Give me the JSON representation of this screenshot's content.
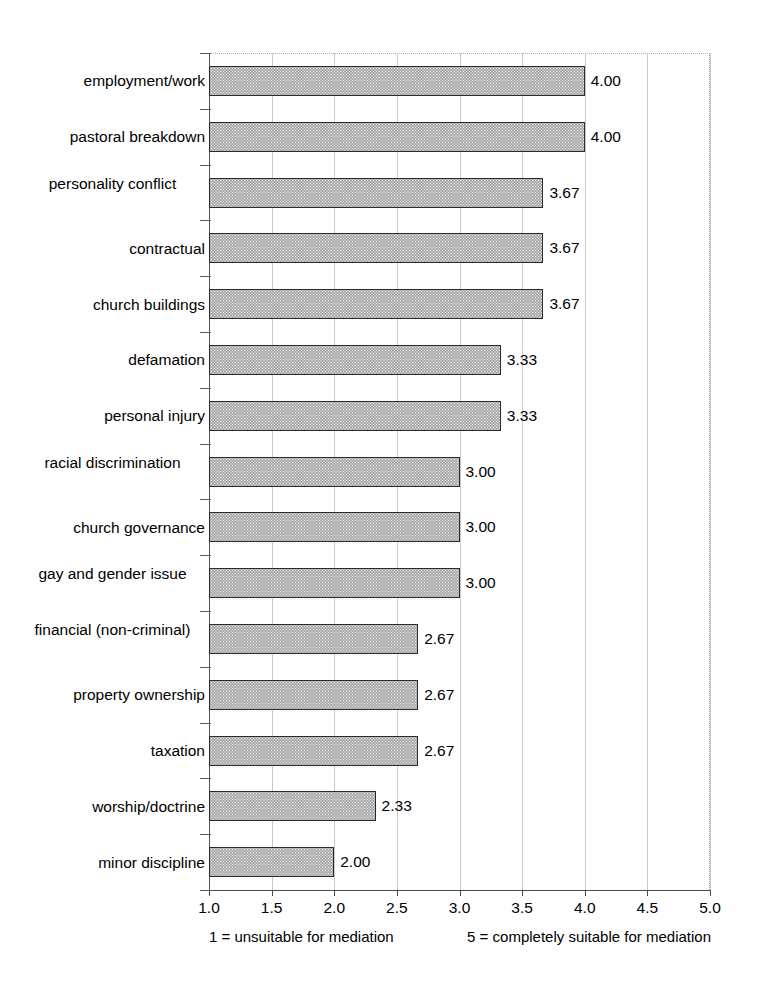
{
  "chart_data": {
    "type": "bar",
    "orientation": "horizontal",
    "title": "",
    "xlabel": "",
    "ylabel": "",
    "xlim": [
      1.0,
      5.0
    ],
    "xticks": [
      "1.0",
      "1.5",
      "2.0",
      "2.5",
      "3.0",
      "3.5",
      "4.0",
      "4.5",
      "5.0"
    ],
    "xtick_values": [
      1.0,
      1.5,
      2.0,
      2.5,
      3.0,
      3.5,
      4.0,
      4.5,
      5.0
    ],
    "grid": true,
    "legend": "none",
    "categories": [
      "employment/work",
      "pastoral breakdown",
      "personality conflict",
      "contractual",
      "church buildings",
      "defamation",
      "personal injury",
      "racial discrimination",
      "church governance",
      "gay and gender issue",
      "financial (non-criminal)",
      "property ownership",
      "taxation",
      "worship/doctrine",
      "minor discipline"
    ],
    "values": [
      4.0,
      4.0,
      3.67,
      3.67,
      3.67,
      3.33,
      3.33,
      3.0,
      3.0,
      3.0,
      2.67,
      2.67,
      2.67,
      2.33,
      2.0
    ],
    "value_labels": [
      "4.00",
      "4.00",
      "3.67",
      "3.67",
      "3.67",
      "3.33",
      "3.33",
      "3.00",
      "3.00",
      "3.00",
      "2.67",
      "2.67",
      "2.67",
      "2.33",
      "2.00"
    ],
    "bar_color": "#a8a8a8",
    "bar_border_color": "#2b2b2b",
    "gridline_color": "#c9c9c9",
    "axis_color": "#4a4a4a"
  },
  "caption": {
    "left": "1 = unsuitable for mediation",
    "right": "5 = completely suitable for mediation"
  }
}
